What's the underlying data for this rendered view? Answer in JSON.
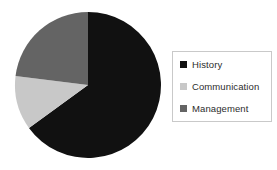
{
  "chart_data": {
    "type": "pie",
    "title": "",
    "categories": [
      "History",
      "Communication",
      "Management"
    ],
    "values": [
      65,
      12,
      23
    ],
    "units": "percent",
    "colors": [
      "#111111",
      "#c8c8c8",
      "#646464"
    ],
    "start_angle_deg": 0,
    "direction": "clockwise",
    "legend_position": "right",
    "grid": false,
    "slices": [
      {
        "label": "History",
        "value": 65,
        "color": "#111111",
        "start_deg": 0,
        "sweep_deg": 234
      },
      {
        "label": "Communication",
        "value": 12,
        "color": "#c8c8c8",
        "start_deg": 234,
        "sweep_deg": 43
      },
      {
        "label": "Management",
        "value": 23,
        "color": "#646464",
        "start_deg": 277,
        "sweep_deg": 83
      }
    ]
  },
  "legend": {
    "items": [
      {
        "label": "History",
        "swatch_color": "#111111",
        "icon": "square-swatch-icon"
      },
      {
        "label": "Communication",
        "swatch_color": "#c8c8c8",
        "icon": "square-swatch-icon"
      },
      {
        "label": "Management",
        "swatch_color": "#646464",
        "icon": "square-swatch-icon"
      }
    ],
    "border_color": "#c9c9c9"
  },
  "figure": {
    "background_color": "#ffffff"
  }
}
